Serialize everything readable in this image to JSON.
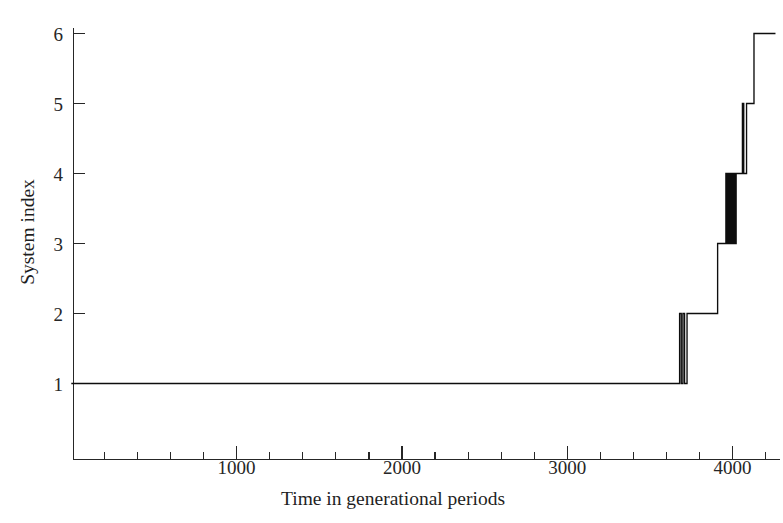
{
  "figure": {
    "background_color": "#ffffff",
    "line_color": "#0d0d0d",
    "axis_color": "#262626"
  },
  "axes": {
    "x_title": "Time in generational periods",
    "y_title": "System index",
    "x_ticks": [
      "1000",
      "2000",
      "3000",
      "4000"
    ],
    "y_ticks": [
      "1",
      "2",
      "3",
      "4",
      "5",
      "6"
    ]
  },
  "chart_data": {
    "type": "line",
    "title": "",
    "subtitle": "",
    "xlabel": "Time in generational periods",
    "ylabel": "System index",
    "xlim": [
      0,
      4300
    ],
    "ylim": [
      0.45,
      6.25
    ],
    "xticks": [
      1000,
      2000,
      3000,
      4000
    ],
    "xticks_minor": [
      200,
      400,
      600,
      800,
      1200,
      1400,
      1600,
      1800,
      2200,
      2400,
      2600,
      2800,
      3200,
      3400,
      3600,
      3800,
      4000,
      4200
    ],
    "yticks": [
      1,
      2,
      3,
      4,
      5,
      6
    ],
    "grid": false,
    "legend": null,
    "legend_position": "none",
    "series": [
      {
        "name": "system index",
        "step": "post",
        "points": [
          [
            0,
            1
          ],
          [
            3680,
            1
          ],
          [
            3680,
            2
          ],
          [
            3690,
            2
          ],
          [
            3690,
            1
          ],
          [
            3700,
            1
          ],
          [
            3700,
            2
          ],
          [
            3710,
            2
          ],
          [
            3710,
            1
          ],
          [
            3725,
            1
          ],
          [
            3725,
            2
          ],
          [
            3910,
            2
          ],
          [
            3910,
            3
          ],
          [
            3960,
            3
          ],
          [
            3960,
            4
          ],
          [
            3968,
            4
          ],
          [
            3968,
            3
          ],
          [
            3975,
            3
          ],
          [
            3975,
            4
          ],
          [
            3982,
            4
          ],
          [
            3982,
            3
          ],
          [
            3990,
            3
          ],
          [
            3990,
            4
          ],
          [
            3998,
            4
          ],
          [
            3998,
            3
          ],
          [
            4006,
            3
          ],
          [
            4006,
            4
          ],
          [
            4014,
            4
          ],
          [
            4014,
            3
          ],
          [
            4022,
            3
          ],
          [
            4022,
            4
          ],
          [
            4060,
            4
          ],
          [
            4060,
            5
          ],
          [
            4068,
            5
          ],
          [
            4068,
            4
          ],
          [
            4085,
            4
          ],
          [
            4085,
            5
          ],
          [
            4130,
            5
          ],
          [
            4130,
            6
          ],
          [
            4260,
            6
          ]
        ]
      }
    ]
  }
}
